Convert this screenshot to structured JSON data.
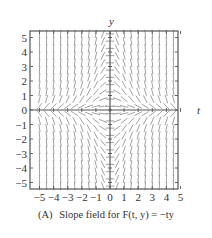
{
  "chart_data": {
    "type": "slope_field",
    "caption": "(A)  Slope field for F(t, y) = −ty",
    "caption_tag": "(A)",
    "caption_text": "Slope field for F(t, y) = −ty",
    "function": "-t*y",
    "xlabel": "t",
    "ylabel": "y",
    "xlim": [
      -5.3,
      5.3
    ],
    "ylim": [
      -5.5,
      5.5
    ],
    "xticks": [
      -5,
      -4,
      -3,
      -2,
      -1,
      0,
      1,
      2,
      3,
      4,
      5
    ],
    "yticks": [
      -5,
      -4,
      -3,
      -2,
      -1,
      0,
      1,
      2,
      3,
      4,
      5
    ],
    "xtick_labels": [
      "−5",
      "−4",
      "−3",
      "−2",
      "−1",
      "0",
      "1",
      "2",
      "3",
      "4",
      "5"
    ],
    "ytick_labels": [
      "−5",
      "−4",
      "−3",
      "−2",
      "−1",
      "0",
      "1",
      "2",
      "3",
      "4",
      "5"
    ],
    "grid_step": 0.5,
    "grid": false,
    "segment_color": "#8a8a8a",
    "axis_color": "#555555",
    "frame_color": "#555555"
  }
}
